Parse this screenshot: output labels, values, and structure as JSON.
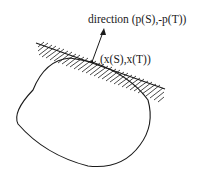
{
  "diagram": {
    "labels": {
      "direction": "direction (p(S),-p(T))",
      "point": "(x(S),x(T))"
    },
    "elements": {
      "boundary_line": "supporting hyperplane with hatching",
      "convex_region": "rounded convex set",
      "arrow": "normal direction vector"
    },
    "colors": {
      "stroke": "#1a1a1a",
      "background": "#ffffff"
    }
  }
}
